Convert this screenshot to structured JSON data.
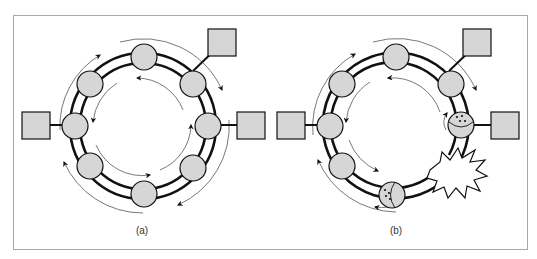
{
  "figure": {
    "panels": [
      {
        "id": "a",
        "caption": "(a)",
        "description": "Dual counter-rotating ring with 8 stations; 3 attached hosts",
        "center": [
          143,
          126
        ],
        "ring_radius": 68,
        "station_count": 8,
        "hosts": [
          "top-right",
          "right",
          "left"
        ]
      },
      {
        "id": "b",
        "caption": "(b)",
        "description": "Ring break: fiber cut between two stations; adjacent stations wrap the ring",
        "center": [
          396,
          126
        ],
        "ring_radius": 68,
        "station_count": 7,
        "wrapped_stations": [
          "right",
          "bottom"
        ],
        "fault": "break",
        "hosts": [
          "top-right",
          "right",
          "left"
        ]
      }
    ],
    "colors": {
      "station_fill": "#d6d6d6",
      "stroke": "#111111",
      "frame": "#a8a8a8",
      "flow_arrow": "#555555"
    }
  }
}
